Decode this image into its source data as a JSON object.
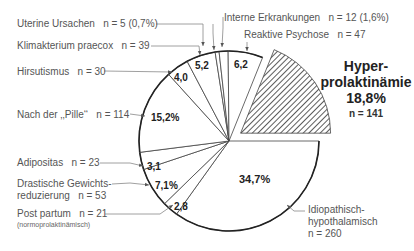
{
  "chart_data": {
    "type": "pie",
    "title": "",
    "start_angle_deg": 0,
    "direction": "clockwise",
    "slices": [
      {
        "label": "Idiopathisch-hypothalamisch",
        "n": 260,
        "percent": 34.7,
        "pct_label": "34,7%",
        "n_label": "n = 260"
      },
      {
        "label": "Post partum",
        "sublabel": "(normoprolaktinämisch)",
        "n": 21,
        "percent": 2.8,
        "pct_label": "2,8",
        "n_label": "n = 21"
      },
      {
        "label": "Drastische Gewichtsreduzierung",
        "n": 53,
        "percent": 7.1,
        "pct_label": "7,1%",
        "n_label": "n = 53"
      },
      {
        "label": "Adipositas",
        "n": 23,
        "percent": 3.1,
        "pct_label": "3,1",
        "n_label": "n = 23"
      },
      {
        "label": "Nach der „Pille“",
        "n": 114,
        "percent": 15.2,
        "pct_label": "15,2%",
        "n_label": "n = 114"
      },
      {
        "label": "Hirsutismus",
        "n": 30,
        "percent": 4.0,
        "pct_label": "4,0",
        "n_label": "n = 30"
      },
      {
        "label": "Klimakterium praecox",
        "n": 39,
        "percent": 5.2,
        "pct_label": "5,2",
        "n_label": "n = 39"
      },
      {
        "label": "Uterine Ursachen",
        "n": 5,
        "percent": 0.7,
        "pct_label": "",
        "n_label": "n = 5 (0,7%)"
      },
      {
        "label": "Interne Erkrankungen",
        "n": 12,
        "percent": 1.6,
        "pct_label": "",
        "n_label": "n = 12 (1,6%)"
      },
      {
        "label": "Reaktive Psychose",
        "n": 47,
        "percent": 6.2,
        "pct_label": "6,2",
        "n_label": "n = 47"
      },
      {
        "label": "Hyperprolaktinämie",
        "n": 141,
        "percent": 18.8,
        "pct_label": "18,8%",
        "n_label": "n = 141",
        "exploded": true,
        "pattern": "diagonal-hatch"
      }
    ],
    "total_n": 745,
    "legend": "none (callout labels with arrows)"
  },
  "labels": {
    "uterine": {
      "name": "Uterine Ursachen",
      "n": "n = 5 (0,7%)"
    },
    "klimakterium": {
      "name": "Klimakterium praecox",
      "n": "n = 39"
    },
    "hirsutismus": {
      "name": "Hirsutismus",
      "n": "n = 30"
    },
    "pille": {
      "name": "Nach der ‚‚Pille‘‘",
      "n": "n = 114"
    },
    "adipositas": {
      "name": "Adipositas",
      "n": "n = 23"
    },
    "drastische_1": "Drastische Gewichts-",
    "drastische_2": "reduzierung",
    "drastische_n": "n = 53",
    "postpartum": {
      "name": "Post partum",
      "n": "n = 21",
      "sub": "(normoprolaktinämisch)"
    },
    "interne": {
      "name": "Interne Erkrankungen",
      "n": "n = 12 (1,6%)"
    },
    "reaktive": {
      "name": "Reaktive Psychose",
      "n": "n = 47"
    },
    "idiopathisch_1": "Idiopathisch-",
    "idiopathisch_2": "hypothalamisch",
    "idiopathisch_n": "n = 260",
    "hyper_1": "Hyper-",
    "hyper_2": "prolaktinämie",
    "hyper_3": "18,8%",
    "hyper_n": "n = 141"
  },
  "percent_labels": {
    "idiopathisch": "34,7%",
    "postpartum": "2,8",
    "drastische": "7,1%",
    "adipositas": "3,1",
    "pille": "15,2%",
    "hirsutismus": "4,0",
    "klimakterium": "5,2",
    "reaktive": "6,2"
  },
  "colors": {
    "line": "#222222",
    "callout": "#777777",
    "hatch": "#333333",
    "text": "#555555"
  }
}
